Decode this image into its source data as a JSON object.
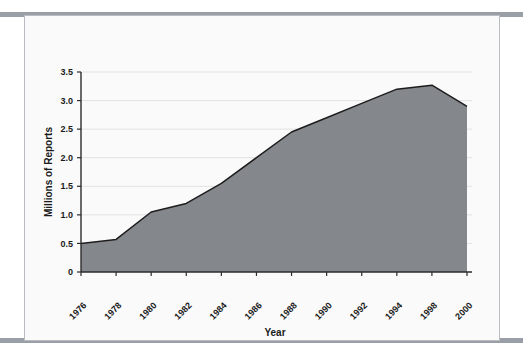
{
  "figure": {
    "background_color": "#fafafa",
    "band_color": "#9a9ea6",
    "area_fill_color": "#84878b",
    "area_line_color": "#1d1d1d"
  },
  "chart_data": {
    "type": "area",
    "title": "",
    "xlabel": "Year",
    "ylabel": "Millions of Reports",
    "categories": [
      "1976",
      "1978",
      "1980",
      "1982",
      "1984",
      "1986",
      "1988",
      "1990",
      "1992",
      "1994",
      "1998",
      "2000"
    ],
    "values": [
      0.5,
      0.57,
      1.05,
      1.2,
      1.55,
      2.0,
      2.45,
      2.7,
      2.95,
      3.2,
      3.27,
      2.9
    ],
    "x_tick_labels": [
      "1976",
      "1978",
      "1980",
      "1982",
      "1984",
      "1986",
      "1988",
      "1990",
      "1992",
      "1994",
      "1998",
      "2000"
    ],
    "y_tick_labels": [
      "0",
      "0.5",
      "1.0",
      "1.5",
      "2.0",
      "2.5",
      "3.0",
      "3.5"
    ],
    "y_tick_values": [
      0,
      0.5,
      1.0,
      1.5,
      2.0,
      2.5,
      3.0,
      3.5
    ],
    "ylim": [
      0,
      3.5
    ],
    "xlim": [
      "1976",
      "2000"
    ],
    "grid": true,
    "legend": null,
    "series": [
      {
        "name": "Millions of Reports",
        "values": [
          0.5,
          0.57,
          1.05,
          1.2,
          1.55,
          2.0,
          2.45,
          2.7,
          2.95,
          3.2,
          3.27,
          2.9
        ]
      }
    ]
  }
}
